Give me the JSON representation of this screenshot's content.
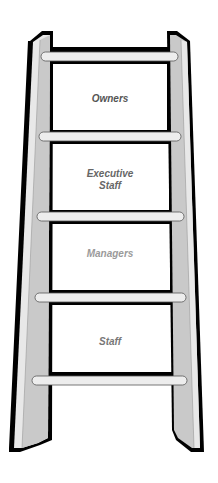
{
  "diagram": {
    "type": "ladder",
    "rungs_count": 5,
    "levels": [
      {
        "label": "Owners",
        "color": "#555555"
      },
      {
        "label": "Executive",
        "label2": "Staff",
        "color": "#666666"
      },
      {
        "label": "Managers",
        "color": "#9a9a9a"
      },
      {
        "label": "Staff",
        "color": "#777777"
      }
    ],
    "colors": {
      "outline": "#000000",
      "rail_light": "#e6e6e6",
      "rail_shade": "#c8c8c8",
      "rung": "#ededed",
      "panel": "#ffffff"
    }
  }
}
